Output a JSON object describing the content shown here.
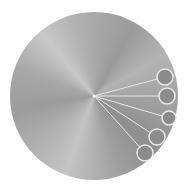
{
  "dial": {
    "center": [
      94,
      96
    ],
    "radius": 84,
    "colors": {
      "node_fill": "#8c8c8c",
      "node_stroke": "#eaeaea",
      "line": "#e6e6e6"
    },
    "nodes": [
      {
        "cx": 165,
        "cy": 77,
        "r": 8
      },
      {
        "cx": 167,
        "cy": 96,
        "r": 8
      },
      {
        "cx": 169,
        "cy": 118,
        "r": 7
      },
      {
        "cx": 157,
        "cy": 137,
        "r": 8
      },
      {
        "cx": 145,
        "cy": 153,
        "r": 8
      }
    ]
  }
}
